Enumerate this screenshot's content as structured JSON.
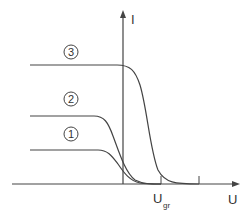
{
  "diagram": {
    "axes": {
      "y_label": "I",
      "x_label": "U",
      "x_tick_label_main": "U",
      "x_tick_label_sub": "gr"
    },
    "curves": [
      {
        "id": "1",
        "label": "1",
        "plateau_level": "low"
      },
      {
        "id": "2",
        "label": "2",
        "plateau_level": "medium"
      },
      {
        "id": "3",
        "label": "3",
        "plateau_level": "high"
      }
    ],
    "colors": {
      "line": "#444444",
      "background": "#ffffff"
    }
  }
}
